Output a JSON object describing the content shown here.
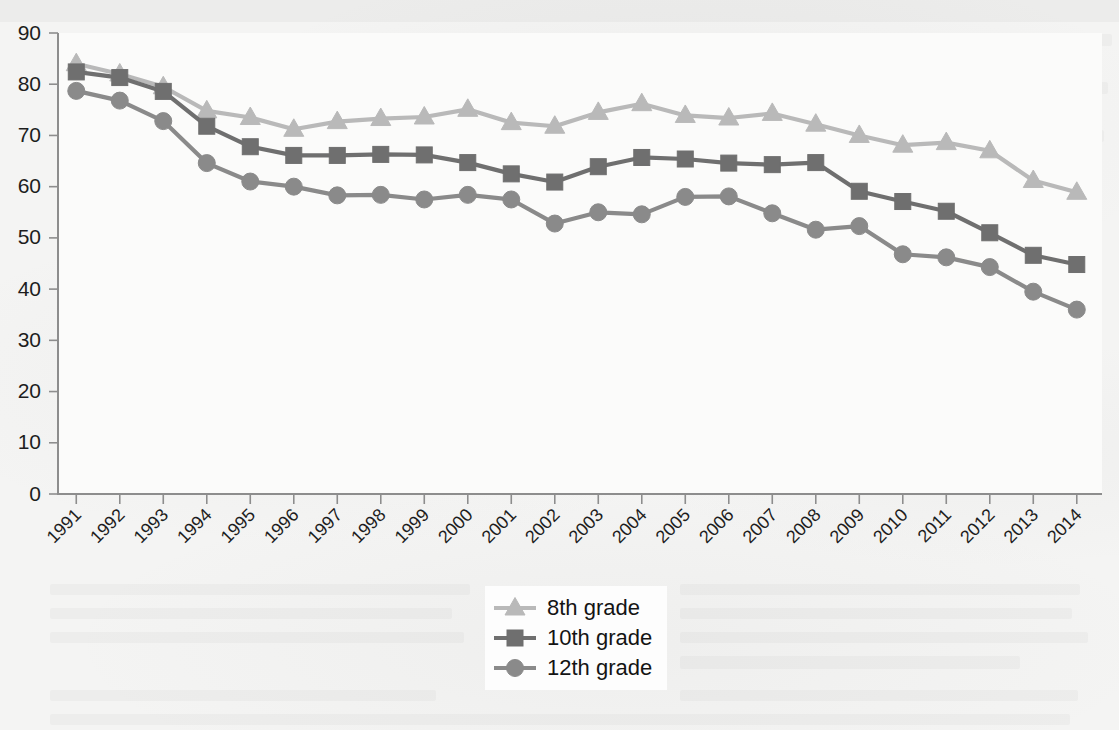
{
  "chart_data": {
    "type": "line",
    "title": "",
    "subtitle": "",
    "xlabel": "",
    "ylabel": "",
    "x": [
      1991,
      1992,
      1993,
      1994,
      1995,
      1996,
      1997,
      1998,
      1999,
      2000,
      2001,
      2002,
      2003,
      2004,
      2005,
      2006,
      2007,
      2008,
      2009,
      2010,
      2011,
      2012,
      2013,
      2014
    ],
    "categories": [
      "1991",
      "1992",
      "1993",
      "1994",
      "1995",
      "1996",
      "1997",
      "1998",
      "1999",
      "2000",
      "2001",
      "2002",
      "2003",
      "2004",
      "2005",
      "2006",
      "2007",
      "2008",
      "2009",
      "2010",
      "2011",
      "2012",
      "2013",
      "2014"
    ],
    "series": [
      {
        "name": "8th grade",
        "marker": "triangle",
        "color": "#b9b9b9",
        "values": [
          84.0,
          82.0,
          79.5,
          74.8,
          73.5,
          71.2,
          72.7,
          73.3,
          73.6,
          75.1,
          72.5,
          71.8,
          74.5,
          76.2,
          73.9,
          73.4,
          74.3,
          72.2,
          70.0,
          68.1,
          68.6,
          67.0,
          61.2,
          58.9
        ]
      },
      {
        "name": "10th grade",
        "marker": "square",
        "color": "#6f6f6f",
        "values": [
          82.4,
          81.3,
          78.6,
          71.8,
          67.8,
          66.1,
          66.1,
          66.3,
          66.2,
          64.7,
          62.5,
          60.9,
          63.9,
          65.7,
          65.4,
          64.6,
          64.3,
          64.7,
          59.1,
          57.1,
          55.2,
          51.0,
          46.6,
          44.8
        ]
      },
      {
        "name": "12th grade",
        "marker": "circle",
        "color": "#8a8a8a",
        "values": [
          78.7,
          76.8,
          72.8,
          64.6,
          61.0,
          60.0,
          58.3,
          58.4,
          57.5,
          58.4,
          57.5,
          52.8,
          55.0,
          54.6,
          58.0,
          58.1,
          54.8,
          51.6,
          52.3,
          46.8,
          46.2,
          44.3,
          39.5,
          36.0
        ]
      }
    ],
    "ylim": [
      0,
      90
    ],
    "yticks": [
      0,
      10,
      20,
      30,
      40,
      50,
      60,
      70,
      80,
      90
    ],
    "grid": false,
    "legend_position": "bottom-center",
    "xtick_rotation": 45
  },
  "legend": {
    "entries": [
      {
        "label": "8th grade",
        "marker": "triangle-icon"
      },
      {
        "label": "10th grade",
        "marker": "square-icon"
      },
      {
        "label": "12th grade",
        "marker": "circle-icon"
      }
    ]
  },
  "colors": {
    "grade8": "#b9b9b9",
    "grade10": "#6f6f6f",
    "grade12": "#8a8a8a",
    "axis": "#8d8d8d",
    "text": "#1d1d1d",
    "page_background": "#f4f4f3",
    "legend_background": "#fdfdfd"
  }
}
